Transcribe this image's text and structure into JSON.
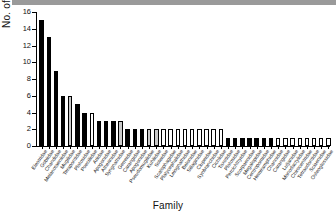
{
  "figure": {
    "xlabel": "Family",
    "ylabel": "No. of species"
  },
  "chart_data": {
    "type": "bar",
    "title": "",
    "xlabel": "Family",
    "ylabel": "No. of species",
    "ylim": [
      0,
      16
    ],
    "yticks": [
      0,
      2,
      4,
      6,
      8,
      10,
      12,
      14,
      16
    ],
    "grid": false,
    "legend": null,
    "colors": {
      "black": "#000000",
      "gray": "#c9c9c9",
      "white": "#ffffff"
    },
    "categories": [
      "Eleotridae",
      "Gobiidae",
      "Chandidae",
      "Melanotaeniidae",
      "Mugilidae",
      "Terapontidae",
      "Plotosidae",
      "Poeciliidae",
      "Ariidae",
      "Apogonidae",
      "Atherinidae",
      "Syngnathidae",
      "Gerreidae",
      "Carangidae",
      "Apogonidae",
      "Pseudomugilidae",
      "Kuhliidae",
      "Soleidae",
      "Scatophagidae",
      "Platycephalidae",
      "Leiognathidae",
      "Belonidae",
      "Sillaginidae",
      "Clupeidae",
      "Synbranchidae",
      "Cichlidae",
      "Toxotidae",
      "Plotosidae",
      "Percichthyidae",
      "Scorpaenidae",
      "Megalopidae",
      "Centropomidae",
      "Hemiramphidae",
      "Channidae",
      "Carangidae",
      "Lutjanidae",
      "Monodactylidae",
      "Chirocentridae",
      "Tetraodontidae",
      "Sciaenidae",
      "Osteoglossidae"
    ],
    "values": [
      15,
      13,
      9,
      6,
      6,
      5,
      4,
      4,
      3,
      3,
      3,
      3,
      2,
      2,
      2,
      2,
      2,
      2,
      2,
      2,
      2,
      2,
      2,
      2,
      2,
      2,
      1,
      1,
      1,
      1,
      1,
      1,
      1,
      1,
      1,
      1,
      1,
      1,
      1,
      1,
      1
    ],
    "fills": [
      "black",
      "black",
      "black",
      "black",
      "gray",
      "black",
      "black",
      "white",
      "black",
      "black",
      "black",
      "gray",
      "black",
      "black",
      "black",
      "gray",
      "gray",
      "white",
      "white",
      "white",
      "white",
      "white",
      "white",
      "white",
      "white",
      "white",
      "black",
      "black",
      "black",
      "black",
      "black",
      "black",
      "black",
      "white",
      "white",
      "white",
      "white",
      "white",
      "white",
      "white",
      "white"
    ]
  }
}
